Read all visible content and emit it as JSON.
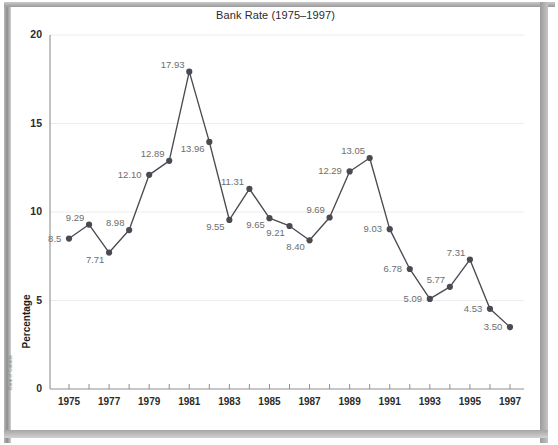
{
  "chart_data": {
    "type": "line",
    "title": "Bank Rate (1975–1997)",
    "xlabel": "",
    "ylabel": "Percentage",
    "source": "Bank of Canada",
    "xlim": [
      1975,
      1997
    ],
    "ylim": [
      0,
      20
    ],
    "yticks": [
      0,
      5,
      10,
      15,
      20
    ],
    "ytick_labels": [
      "0",
      "5",
      "10",
      "15",
      "20"
    ],
    "xticks": [
      1975,
      1976,
      1977,
      1978,
      1979,
      1980,
      1981,
      1982,
      1983,
      1984,
      1985,
      1986,
      1987,
      1988,
      1989,
      1990,
      1991,
      1992,
      1993,
      1994,
      1995,
      1996,
      1997
    ],
    "xtick_labels": [
      "1975",
      "",
      "1977",
      "",
      "1979",
      "",
      "1981",
      "",
      "1983",
      "",
      "1985",
      "",
      "1987",
      "",
      "1989",
      "",
      "1991",
      "",
      "1993",
      "",
      "1995",
      "",
      "1997"
    ],
    "grid": "horizontal",
    "legend": "none",
    "series_color": "#4a4a52",
    "label_color": "#6d6d6d",
    "categories": [
      1975,
      1976,
      1977,
      1978,
      1979,
      1980,
      1981,
      1982,
      1983,
      1984,
      1985,
      1986,
      1987,
      1988,
      1989,
      1990,
      1991,
      1992,
      1993,
      1994,
      1995,
      1996,
      1997
    ],
    "values": [
      8.5,
      9.29,
      7.71,
      8.98,
      12.1,
      12.89,
      17.93,
      13.96,
      9.55,
      11.31,
      9.65,
      9.21,
      8.4,
      9.69,
      12.29,
      13.05,
      9.03,
      6.78,
      5.09,
      5.77,
      7.31,
      4.53,
      3.5
    ],
    "point_labels": [
      "8.5",
      "9.29",
      "7.71",
      "8.98",
      "12.10",
      "12.89",
      "17.93",
      "13.96",
      "9.55",
      "11.31",
      "9.65",
      "9.21",
      "8.40",
      "9.69",
      "12.29",
      "13.05",
      "9.03",
      "6.78",
      "5.09",
      "5.77",
      "7.31",
      "4.53",
      "3.50"
    ],
    "label_positions": [
      "left",
      "above",
      "below",
      "above",
      "left",
      "above",
      "above",
      "below",
      "below",
      "above",
      "below",
      "below",
      "below",
      "above",
      "left",
      "above",
      "left",
      "left",
      "left",
      "above",
      "above",
      "left",
      "left"
    ]
  }
}
